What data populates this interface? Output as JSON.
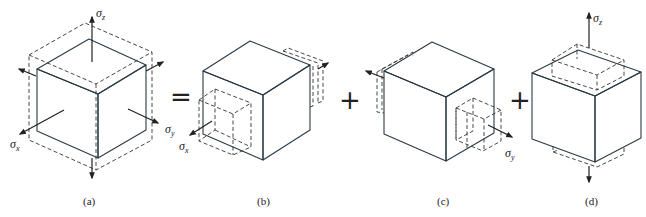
{
  "figure": {
    "type": "stress-superposition-diagram",
    "colors": {
      "top_face": "#d7edf5",
      "left_face": "#a9d4e6",
      "right_face": "#73b3d0",
      "edge": "#2a3a44",
      "dashed": "#333333"
    },
    "operators": [
      "=",
      "+",
      "+"
    ],
    "panels": [
      {
        "id": "a",
        "caption": "(a)",
        "description": "Cube under triaxial stress sigma_x, sigma_y, sigma_z with dashed deformed outline",
        "stress_labels": [
          {
            "symbol": "σ",
            "subscript": "z"
          },
          {
            "symbol": "σ",
            "subscript": "x"
          },
          {
            "symbol": "σ",
            "subscript": "y"
          }
        ]
      },
      {
        "id": "b",
        "caption": "(b)",
        "description": "Cube under uniaxial stress sigma_x only",
        "stress_labels": [
          {
            "symbol": "σ",
            "subscript": "x"
          }
        ]
      },
      {
        "id": "c",
        "caption": "(c)",
        "description": "Cube under uniaxial stress sigma_y only",
        "stress_labels": [
          {
            "symbol": "σ",
            "subscript": "y"
          }
        ]
      },
      {
        "id": "d",
        "caption": "(d)",
        "description": "Cube under uniaxial stress sigma_z only",
        "stress_labels": [
          {
            "symbol": "σ",
            "subscript": "z"
          }
        ]
      }
    ]
  }
}
